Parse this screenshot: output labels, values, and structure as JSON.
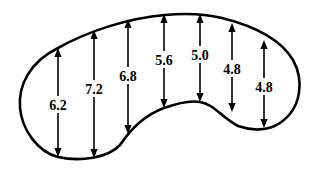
{
  "diagram": {
    "type": "cross-section-dimensions",
    "line_color": "#000000",
    "background_color": "#ffffff",
    "measurements": [
      {
        "label": "6.2",
        "value": 6.2
      },
      {
        "label": "7.2",
        "value": 7.2
      },
      {
        "label": "6.8",
        "value": 6.8
      },
      {
        "label": "5.6",
        "value": 5.6
      },
      {
        "label": "5.0",
        "value": 5.0
      },
      {
        "label": "4.8",
        "value": 4.8
      },
      {
        "label": "4.8",
        "value": 4.8
      }
    ]
  }
}
